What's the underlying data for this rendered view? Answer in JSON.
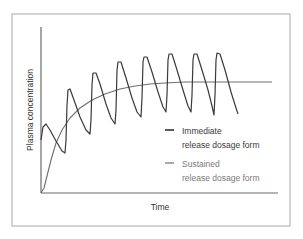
{
  "chart_data": {
    "type": "line",
    "title": "",
    "xlabel": "Time",
    "ylabel": "Plasma concentration",
    "grid": false,
    "legend_position": "inside-right",
    "axis_ticks": "none",
    "ylim": [
      0,
      100
    ],
    "xlim": [
      0,
      100
    ],
    "series": [
      {
        "name": "Immediate release dosage form",
        "color": "#3a3a3a",
        "description": "Oscillating curve: repeated doses cause sharp peaks and troughs rising toward a steady-state band",
        "points_px": [
          [
            41,
            140
          ],
          [
            43,
            127
          ],
          [
            46,
            124
          ],
          [
            50,
            130
          ],
          [
            56,
            141
          ],
          [
            62,
            151
          ],
          [
            65,
            153
          ],
          [
            66,
            140
          ],
          [
            67,
            105
          ],
          [
            68,
            90
          ],
          [
            70,
            89
          ],
          [
            74,
            100
          ],
          [
            80,
            117
          ],
          [
            86,
            130
          ],
          [
            90,
            134
          ],
          [
            91,
            120
          ],
          [
            92,
            85
          ],
          [
            93,
            73
          ],
          [
            96,
            73
          ],
          [
            100,
            84
          ],
          [
            106,
            104
          ],
          [
            111,
            118
          ],
          [
            115,
            124
          ],
          [
            116,
            110
          ],
          [
            117,
            70
          ],
          [
            118,
            62
          ],
          [
            121,
            62
          ],
          [
            126,
            78
          ],
          [
            132,
            98
          ],
          [
            137,
            112
          ],
          [
            141,
            117
          ],
          [
            142,
            98
          ],
          [
            143,
            62
          ],
          [
            144,
            57
          ],
          [
            147,
            57
          ],
          [
            152,
            72
          ],
          [
            158,
            92
          ],
          [
            163,
            107
          ],
          [
            166,
            112
          ],
          [
            167,
            95
          ],
          [
            168,
            60
          ],
          [
            169,
            54
          ],
          [
            172,
            54
          ],
          [
            177,
            70
          ],
          [
            183,
            90
          ],
          [
            188,
            106
          ],
          [
            191,
            112
          ],
          [
            192,
            95
          ],
          [
            193,
            60
          ],
          [
            194,
            54
          ],
          [
            197,
            54
          ],
          [
            202,
            70
          ],
          [
            208,
            90
          ],
          [
            212,
            106
          ],
          [
            214,
            115
          ],
          [
            215,
            95
          ],
          [
            216,
            60
          ],
          [
            217,
            53
          ],
          [
            220,
            54
          ],
          [
            225,
            70
          ],
          [
            231,
            92
          ],
          [
            236,
            108
          ],
          [
            238,
            114
          ]
        ],
        "approx_values": {
          "first_peak": 41,
          "steady_peaks": 84,
          "steady_troughs": 48
        }
      },
      {
        "name": "Sustained release dosage form",
        "color": "#6e6e6e",
        "description": "Smooth curve rising from zero to a plateau near the middle of the immediate-release oscillation",
        "points_px": [
          [
            41,
            193
          ],
          [
            44,
            188
          ],
          [
            47,
            176
          ],
          [
            51,
            160
          ],
          [
            56,
            143
          ],
          [
            62,
            130
          ],
          [
            70,
            118
          ],
          [
            80,
            108
          ],
          [
            92,
            100
          ],
          [
            105,
            94
          ],
          [
            120,
            89
          ],
          [
            135,
            86
          ],
          [
            150,
            84
          ],
          [
            165,
            83
          ],
          [
            185,
            82
          ],
          [
            210,
            82
          ],
          [
            240,
            82
          ],
          [
            272,
            82
          ]
        ],
        "approx_values": {
          "start": 0,
          "plateau": 67
        }
      }
    ]
  },
  "legend": {
    "items": [
      {
        "line1": "Immediate",
        "line2": "release dosage form",
        "color": "#333333",
        "text_color": "#3a3a3a"
      },
      {
        "line1": "Sustained",
        "line2": "release dosage form",
        "color": "#6e6e6e",
        "text_color": "#7a7a7a"
      }
    ]
  },
  "axes": {
    "x_label": "Time",
    "y_label": "Plasma concentration"
  },
  "colors": {
    "frame": "#a8a8a8",
    "axis": "#6a6a6a",
    "background": "#ffffff"
  }
}
